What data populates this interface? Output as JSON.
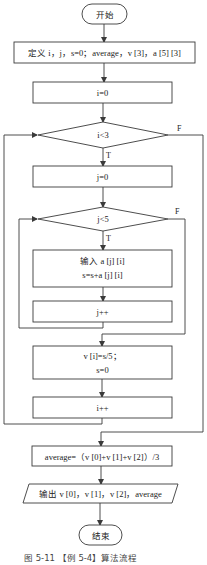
{
  "flowchart": {
    "start": {
      "label": "开始"
    },
    "define": {
      "label": "定义 i，j，s=0；average，v [3]，a [5] [3]"
    },
    "init_i": {
      "label": "i=0"
    },
    "cond_i": {
      "label": "i<3",
      "true_label": "T",
      "false_label": "F"
    },
    "init_j": {
      "label": "j=0"
    },
    "cond_j": {
      "label": "j<5",
      "true_label": "T",
      "false_label": "F"
    },
    "input": {
      "line1": "输入 a [j] [i]",
      "line2": "s=s+a [j] [i]"
    },
    "inc_j": {
      "label": "j++"
    },
    "avg_v": {
      "line1": "v [i]=s/5；",
      "line2": "s=0"
    },
    "inc_i": {
      "label": "i++"
    },
    "average": {
      "label": "average=（v [0]+v [1]+v [2]）/3"
    },
    "output": {
      "label": "输出 v [0]，v [1]，v [2]，average"
    },
    "end": {
      "label": "结束"
    }
  },
  "caption": "图 5-11   【例 5-4】算法流程",
  "colors": {
    "stroke": "#3a3a3a",
    "text": "#222222",
    "background": "#ffffff"
  }
}
